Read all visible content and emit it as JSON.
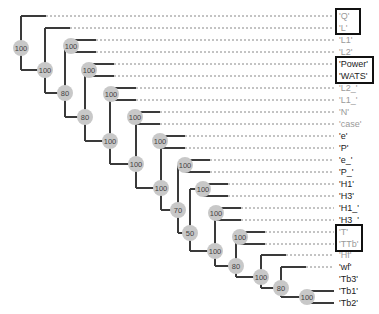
{
  "diagram": {
    "type": "phylogenetic-tree",
    "leaf_label_x": 339,
    "leaves": [
      {
        "id": "Q",
        "label": "'Q'",
        "y": 16,
        "tone": "gray",
        "branch_x": 8,
        "tip_x": 21,
        "dashed": true
      },
      {
        "id": "L",
        "label": "'L'",
        "y": 28,
        "tone": "gray",
        "branch_x": 21,
        "tip_x": 45,
        "dashed": true
      },
      {
        "id": "L1",
        "label": "'L1'",
        "y": 40,
        "tone": "gray",
        "branch_x": 71,
        "tip_x": 95,
        "dashed": true
      },
      {
        "id": "L2",
        "label": "'L2'",
        "y": 52,
        "tone": "gray",
        "branch_x": 71,
        "tip_x": 95,
        "dashed": true
      },
      {
        "id": "Power",
        "label": "'Power'",
        "y": 64,
        "tone": "dark",
        "branch_x": 89,
        "tip_x": 115,
        "dashed": true
      },
      {
        "id": "WATS",
        "label": "'WATS'",
        "y": 76,
        "tone": "dark",
        "branch_x": 89,
        "tip_x": 115,
        "dashed": true
      },
      {
        "id": "L2_",
        "label": "'L2_'",
        "y": 88,
        "tone": "gray",
        "branch_x": 111,
        "tip_x": 135,
        "dashed": true
      },
      {
        "id": "L1_",
        "label": "'L1_'",
        "y": 100,
        "tone": "gray",
        "branch_x": 111,
        "tip_x": 135,
        "dashed": true
      },
      {
        "id": "N",
        "label": "'N'",
        "y": 112,
        "tone": "gray",
        "branch_x": 135,
        "tip_x": 160,
        "dashed": true
      },
      {
        "id": "case",
        "label": "'case'",
        "y": 124,
        "tone": "gray",
        "branch_x": 135,
        "tip_x": 160,
        "dashed": true
      },
      {
        "id": "e",
        "label": "'e'",
        "y": 136,
        "tone": "dark",
        "branch_x": 160,
        "tip_x": 190,
        "dashed": true
      },
      {
        "id": "P",
        "label": "'P'",
        "y": 148,
        "tone": "dark",
        "branch_x": 160,
        "tip_x": 190,
        "dashed": true
      },
      {
        "id": "e_",
        "label": "'e_'",
        "y": 160,
        "tone": "dark",
        "branch_x": 136,
        "tip_x": 185,
        "dashed": true
      },
      {
        "id": "P_",
        "label": "'P_'",
        "y": 172,
        "tone": "dark",
        "branch_x": 185,
        "tip_x": 210,
        "dashed": true
      },
      {
        "id": "H1",
        "label": "'H1'",
        "y": 184,
        "tone": "dark",
        "branch_x": 185,
        "tip_x": 210,
        "dashed": true
      },
      {
        "id": "H3",
        "label": "'H3'",
        "y": 196,
        "tone": "dark",
        "branch_x": 203,
        "tip_x": 228,
        "dashed": true
      },
      {
        "id": "H1_",
        "label": "'H1_'",
        "y": 208,
        "tone": "dark",
        "branch_x": 216,
        "tip_x": 240,
        "dashed": true
      },
      {
        "id": "H3_",
        "label": "'H3_'",
        "y": 220,
        "tone": "dark",
        "branch_x": 216,
        "tip_x": 240,
        "dashed": true
      },
      {
        "id": "T",
        "label": "'T'",
        "y": 232,
        "tone": "gray",
        "branch_x": 240,
        "tip_x": 265,
        "dashed": true
      },
      {
        "id": "TTb",
        "label": "'TTb'",
        "y": 244,
        "tone": "gray",
        "branch_x": 240,
        "tip_x": 265,
        "dashed": true
      },
      {
        "id": "Hf",
        "label": "'Hf'",
        "y": 255,
        "tone": "gray",
        "branch_x": 236,
        "tip_x": 262,
        "dashed": true
      },
      {
        "id": "wf",
        "label": "'wf'",
        "y": 267,
        "tone": "dark",
        "branch_x": 261,
        "tip_x": 284,
        "dashed": true
      },
      {
        "id": "Tb3",
        "label": "'Tb3'",
        "y": 279,
        "tone": "dark",
        "branch_x": 281,
        "tip_x": 304,
        "dashed": true
      },
      {
        "id": "Tb1",
        "label": "'Tb1'",
        "y": 291,
        "tone": "dark",
        "branch_x": 307,
        "tip_x": 332,
        "dashed": false
      },
      {
        "id": "Tb2",
        "label": "'Tb2'",
        "y": 303,
        "tone": "dark",
        "branch_x": 307,
        "tip_x": 332,
        "dashed": false
      }
    ],
    "nodes": [
      {
        "id": "n1",
        "label": "100",
        "x": 21,
        "y": 48
      },
      {
        "id": "n2",
        "label": "100",
        "x": 45,
        "y": 70
      },
      {
        "id": "n3",
        "label": "100",
        "x": 71,
        "y": 46
      },
      {
        "id": "n4",
        "label": "80",
        "x": 65,
        "y": 93
      },
      {
        "id": "n5",
        "label": "100",
        "x": 89,
        "y": 70
      },
      {
        "id": "n6",
        "label": "80",
        "x": 85,
        "y": 117
      },
      {
        "id": "n7",
        "label": "100",
        "x": 111,
        "y": 94
      },
      {
        "id": "n8",
        "label": "100",
        "x": 110,
        "y": 141
      },
      {
        "id": "n9",
        "label": "100",
        "x": 135,
        "y": 117
      },
      {
        "id": "n10",
        "label": "100",
        "x": 160,
        "y": 141
      },
      {
        "id": "n11",
        "label": "100",
        "x": 136,
        "y": 164
      },
      {
        "id": "n12",
        "label": "100",
        "x": 185,
        "y": 165
      },
      {
        "id": "n13",
        "label": "100",
        "x": 161,
        "y": 188
      },
      {
        "id": "n14",
        "label": "100",
        "x": 203,
        "y": 189
      },
      {
        "id": "n15",
        "label": "70",
        "x": 178,
        "y": 210
      },
      {
        "id": "n16",
        "label": "100",
        "x": 216,
        "y": 213
      },
      {
        "id": "n17",
        "label": "50",
        "x": 190,
        "y": 233
      },
      {
        "id": "n18",
        "label": "100",
        "x": 240,
        "y": 237
      },
      {
        "id": "n19",
        "label": "100",
        "x": 215,
        "y": 251
      },
      {
        "id": "n20",
        "label": "80",
        "x": 236,
        "y": 266
      },
      {
        "id": "n21",
        "label": "100",
        "x": 261,
        "y": 277
      },
      {
        "id": "n22",
        "label": "80",
        "x": 281,
        "y": 288
      },
      {
        "id": "n23",
        "label": "100",
        "x": 307,
        "y": 297
      }
    ],
    "highlight_boxes": [
      {
        "name": "box-q-l",
        "x": 335,
        "y": 8,
        "w": 26,
        "h": 27
      },
      {
        "name": "box-power-wats",
        "x": 335,
        "y": 56,
        "w": 39,
        "h": 28
      },
      {
        "name": "box-t-ttb",
        "x": 335,
        "y": 224,
        "w": 28,
        "h": 28
      }
    ],
    "colors": {
      "branch": "#3a3a3a",
      "dashed": "#888888",
      "node_fill": "#c8c8c8",
      "node_text": "#444444",
      "label_dark": "#222222",
      "label_gray": "#9a9a9a",
      "box": "#111111"
    }
  }
}
